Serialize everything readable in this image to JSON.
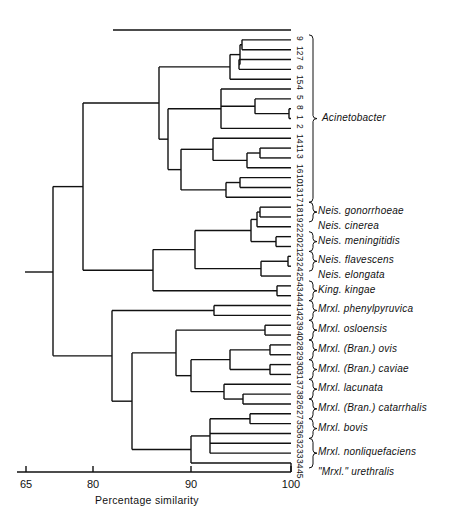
{
  "chart_data": {
    "type": "dendrogram",
    "title": "",
    "xlabel": "Percentage similarity",
    "ylabel": "",
    "x_ticks": [
      65,
      80,
      90,
      100
    ],
    "axis_note": "broken scale between 65 and 80",
    "xlim": [
      65,
      100
    ],
    "leaves": [
      "",
      "9",
      "12",
      "7",
      "6",
      "15",
      "4",
      "5",
      "8",
      "1",
      "2",
      "14",
      "11",
      "3",
      "16",
      "10",
      "13",
      "17",
      "18",
      "19",
      "22",
      "20",
      "21",
      "23",
      "24",
      "25",
      "43",
      "44",
      "41",
      "42",
      "39",
      "40",
      "28",
      "29",
      "30",
      "31",
      "37",
      "38",
      "26",
      "27",
      "35",
      "36",
      "32",
      "33",
      "34",
      "45"
    ],
    "groups": [
      {
        "label": "Acinetobacter",
        "leaves": [
          "9",
          "12",
          "7",
          "6",
          "15",
          "4",
          "5",
          "8",
          "1",
          "2",
          "14",
          "11",
          "3",
          "16",
          "10",
          "13",
          "17"
        ],
        "brace": true
      },
      {
        "label": "Neis. gonorrhoeae",
        "leaves": [
          "18",
          "19"
        ],
        "brace": true
      },
      {
        "label": "Neis. cinerea",
        "leaves": [
          "22"
        ],
        "brace": false
      },
      {
        "label": "Neis. meningitidis",
        "leaves": [
          "20",
          "21"
        ],
        "brace": true
      },
      {
        "label": "Neis. flavescens",
        "leaves": [
          "23",
          "24"
        ],
        "brace": true
      },
      {
        "label": "Neis. elongata",
        "leaves": [
          "25"
        ],
        "brace": false
      },
      {
        "label": "King. kingae",
        "leaves": [
          "43",
          "44"
        ],
        "brace": true
      },
      {
        "label": "Mrxl. phenylpyruvica",
        "leaves": [
          "41",
          "42"
        ],
        "brace": true
      },
      {
        "label": "Mrxl. osloensis",
        "leaves": [
          "39",
          "40"
        ],
        "brace": true
      },
      {
        "label": "Mrxl. (Bran.) ovis",
        "leaves": [
          "28",
          "29"
        ],
        "brace": true
      },
      {
        "label": "Mrxl. (Bran.) caviae",
        "leaves": [
          "30",
          "31"
        ],
        "brace": true
      },
      {
        "label": "Mrxl. lacunata",
        "leaves": [
          "37",
          "38"
        ],
        "brace": true
      },
      {
        "label": "Mrxl. (Bran.) catarrhalis",
        "leaves": [
          "26",
          "27"
        ],
        "brace": true
      },
      {
        "label": "Mrxl. bovis",
        "leaves": [
          "35",
          "36"
        ],
        "brace": true
      },
      {
        "label": "Mrxl. nonliquefaciens",
        "leaves": [
          "32",
          "33",
          "34"
        ],
        "brace": true
      },
      {
        "label": "\"Mrxl.\" urethralis",
        "leaves": [
          "45"
        ],
        "brace": false
      }
    ],
    "clusters_approx_similarity": {
      "root": 68,
      "acinetobacter_vs_neisseria_kingella": 78,
      "acinetobacter": 83,
      "neisseria_kingella": 88,
      "neisseria": 90,
      "moraxella_group": 81,
      "moraxella_subgroup": 84,
      "mrxl_phenylpyruvica_pair": 98,
      "mrxl_osloensis_pair": 98
    }
  },
  "axis": {
    "ticks": [
      {
        "label": "65",
        "x": 26
      },
      {
        "label": "80",
        "x": 93
      },
      {
        "label": "90",
        "x": 191
      },
      {
        "label": "100",
        "x": 291
      }
    ],
    "title": "Percentage similarity"
  }
}
